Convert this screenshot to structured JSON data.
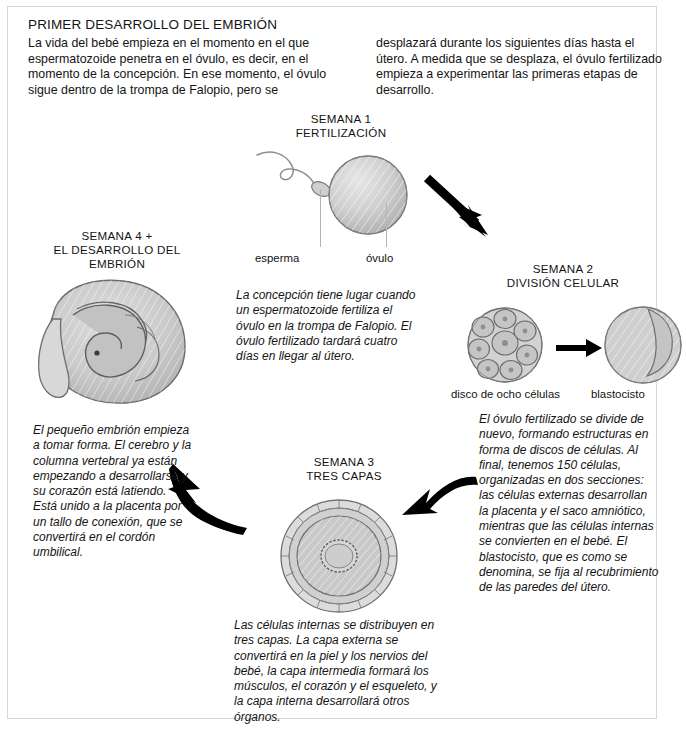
{
  "document": {
    "title": "PRIMER DESARROLLO DEL EMBRIÓN",
    "intro_left": "La vida del bebé empieza en el momento en el que espermatozoide penetra en el óvulo, es decir, en el momento de la concepción. En ese momento, el óvulo sigue dentro de la trompa de Falopio, pero se",
    "intro_right": "desplazará durante los siguientes días hasta el útero. A medida que se desplaza, el óvulo fertilizado empieza a experimentar las primeras etapas de desarrollo."
  },
  "stages": {
    "week1": {
      "heading_line1": "SEMANA 1",
      "heading_line2": "FERTILIZACIÓN",
      "label_sperm": "esperma",
      "label_egg": "óvulo",
      "caption": "La concepción tiene lugar cuando un espermatozoide fertiliza el óvulo en la trompa de Falopio. El óvulo fertilizado tardará cuatro días en llegar al útero."
    },
    "week2": {
      "heading_line1": "SEMANA 2",
      "heading_line2": "DIVISIÓN CELULAR",
      "label_disc": "disco de ocho células",
      "label_blastocyst": "blastocisto",
      "caption": "El óvulo fertilizado se divide de nuevo, formando estructuras en forma de discos de células. Al final, tenemos 150 células, organizadas en dos secciones: las células externas desarrollan la placenta y el saco amniótico, mientras que las células internas se convierten en el bebé. El blastocisto, que es como se denomina, se fija al recubrimiento de las paredes del útero."
    },
    "week3": {
      "heading_line1": "SEMANA 3",
      "heading_line2": "TRES CAPAS",
      "caption": "Las células internas se distribuyen en tres capas. La capa externa se convertirá en la piel y los nervios del bebé, la capa intermedia formará los músculos, el corazón y el esqueleto, y la capa interna desarrollará otros órganos."
    },
    "week4": {
      "heading_line1": "SEMANA 4 +",
      "heading_line2": "EL DESARROLLO DEL",
      "heading_line3": "EMBRIÓN",
      "caption": "El pequeño embrión empieza a tomar forma. El cerebro y la columna vertebral ya están empezando a desarrollarse y su corazón está latiendo. Está unido a la placenta por un tallo de conexión, que se convertirá en el cordón umbilical."
    }
  },
  "colors": {
    "ink": "#141414",
    "cell_fill": "#c9c9c9",
    "cell_stroke": "#6e6e6e",
    "arrow": "#000000",
    "frame": "#d8d8d8"
  }
}
